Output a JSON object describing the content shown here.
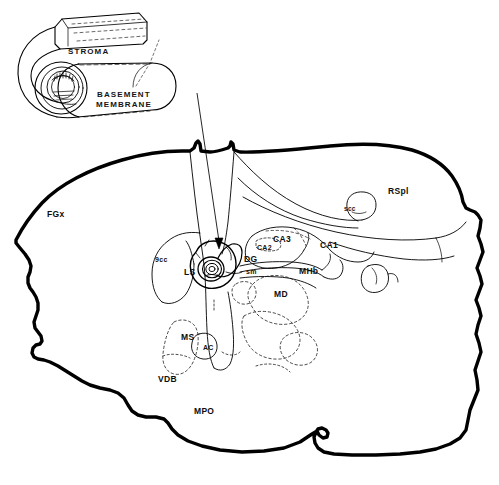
{
  "figure": {
    "background_color": "#ffffff",
    "ink_color": "#000000",
    "width": 499,
    "height": 485
  },
  "inset": {
    "name": "tissue-roll-schematic",
    "description": "Schematic of a rolled sheet of tissue showing stroma and basement membrane layers",
    "labels": [
      {
        "id": "stroma",
        "text": "STROMA",
        "x": 68,
        "y": 48
      },
      {
        "id": "basement-membrane-line1",
        "text": "BASEMENT",
        "x": 97,
        "y": 91
      },
      {
        "id": "basement-membrane-line2",
        "text": "MEMBRANE",
        "x": 96,
        "y": 101
      }
    ]
  },
  "pointer": {
    "name": "inset-to-implant-arrow",
    "description": "Thin arrow from the tissue roll schematic to the implant site in the brain section",
    "from": {
      "x": 197,
      "y": 93
    },
    "to": {
      "x": 221,
      "y": 247
    }
  },
  "brain_section": {
    "name": "coronal-brain-section",
    "description": "Outline drawing of a coronal section through the rat forebrain at the level of the septum and dorsal hippocampus",
    "labels": [
      {
        "id": "FCx",
        "text": "FGx",
        "x": 47,
        "y": 210,
        "size": "region",
        "note": "frontal cortex"
      },
      {
        "id": "gcc",
        "text": "9cc",
        "x": 155,
        "y": 256,
        "size": "small",
        "note": "genu of the corpus callosum"
      },
      {
        "id": "LS",
        "text": "LS",
        "x": 184,
        "y": 268,
        "size": "region",
        "note": "lateral septum"
      },
      {
        "id": "DG",
        "text": "DG",
        "x": 244,
        "y": 255,
        "size": "region",
        "note": "dentate gyrus"
      },
      {
        "id": "CA2",
        "text": "CA2",
        "x": 257,
        "y": 244,
        "size": "small",
        "note": "hippocampal field CA2"
      },
      {
        "id": "CA3",
        "text": "CA3",
        "x": 273,
        "y": 235,
        "size": "region",
        "note": "hippocampal field CA3"
      },
      {
        "id": "CA1",
        "text": "CA1",
        "x": 320,
        "y": 241,
        "size": "region",
        "note": "hippocampal field CA1"
      },
      {
        "id": "sm",
        "text": "sm",
        "x": 246,
        "y": 268,
        "size": "small",
        "note": "stria medullaris"
      },
      {
        "id": "MHb",
        "text": "MHb",
        "x": 299,
        "y": 267,
        "size": "region",
        "note": "medial habenula"
      },
      {
        "id": "MD",
        "text": "MD",
        "x": 274,
        "y": 290,
        "size": "region",
        "note": "mediodorsal thalamic nucleus"
      },
      {
        "id": "scc",
        "text": "scc",
        "x": 344,
        "y": 206,
        "size": "tiny",
        "note": "splenium of the corpus callosum"
      },
      {
        "id": "RSpl",
        "text": "RSpl",
        "x": 388,
        "y": 187,
        "size": "region",
        "note": "retrosplenial cortex"
      },
      {
        "id": "MS",
        "text": "MS",
        "x": 181,
        "y": 333,
        "size": "region",
        "note": "medial septum"
      },
      {
        "id": "AC",
        "text": "AC",
        "x": 203,
        "y": 344,
        "size": "small",
        "note": "anterior commissure"
      },
      {
        "id": "VDB",
        "text": "VDB",
        "x": 158,
        "y": 375,
        "size": "region",
        "note": "vertical limb of the diagonal band"
      },
      {
        "id": "MPO",
        "text": "MPO",
        "x": 194,
        "y": 407,
        "size": "region",
        "note": "medial preoptic area"
      }
    ]
  }
}
